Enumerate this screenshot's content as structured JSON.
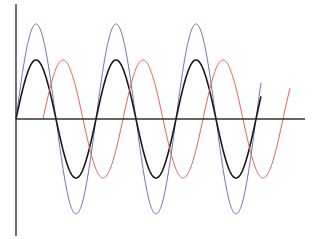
{
  "chart_data": {
    "type": "line",
    "title": "",
    "xlabel": "",
    "ylabel": "",
    "grid": false,
    "legend": null,
    "axis": {
      "origin_px": [
        16,
        119
      ],
      "y_axis_top_px": 4,
      "y_axis_bottom_px": 236,
      "x_axis_end_px": 305,
      "axis_color": "#333333"
    },
    "series": [
      {
        "name": "blue-sine",
        "color": "#6e70c0",
        "amplitude_px": 95,
        "period_px": 80,
        "phase_px": 0,
        "x_start_px": 16,
        "x_end_px": 261,
        "stroke_width": 1
      },
      {
        "name": "black-sine",
        "color": "#1a1a1a",
        "amplitude_px": 59,
        "period_px": 80,
        "phase_px": 0,
        "x_start_px": 16,
        "x_end_px": 261,
        "stroke_width": 1.6
      },
      {
        "name": "red-sine",
        "color": "#e0604a",
        "amplitude_px": 59,
        "period_px": 80,
        "phase_px": 27,
        "x_start_px": 43,
        "x_end_px": 290,
        "stroke_width": 1
      }
    ]
  }
}
